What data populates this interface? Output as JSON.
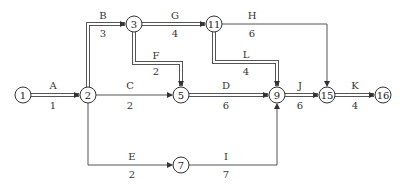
{
  "diagram": {
    "type": "activity-on-arrow network (double-line arrows mark critical path)",
    "nodes": [
      {
        "id": "1",
        "label": "1",
        "x": 23,
        "y": 95
      },
      {
        "id": "2",
        "label": "2",
        "x": 88,
        "y": 95
      },
      {
        "id": "3",
        "label": "3",
        "x": 134,
        "y": 24
      },
      {
        "id": "11",
        "label": "11",
        "x": 214,
        "y": 24
      },
      {
        "id": "5",
        "label": "5",
        "x": 181,
        "y": 95
      },
      {
        "id": "9",
        "label": "9",
        "x": 277,
        "y": 95
      },
      {
        "id": "15",
        "label": "15",
        "x": 327,
        "y": 95
      },
      {
        "id": "16",
        "label": "16",
        "x": 383,
        "y": 95
      },
      {
        "id": "7",
        "label": "7",
        "x": 181,
        "y": 165
      }
    ],
    "activities": [
      {
        "name": "A",
        "duration": "1",
        "from": "1",
        "to": "2",
        "critical": true
      },
      {
        "name": "B",
        "duration": "3",
        "from": "2",
        "to": "3",
        "critical": true
      },
      {
        "name": "C",
        "duration": "2",
        "from": "2",
        "to": "5",
        "critical": false
      },
      {
        "name": "E",
        "duration": "2",
        "from": "2",
        "to": "7",
        "critical": false
      },
      {
        "name": "G",
        "duration": "4",
        "from": "3",
        "to": "11",
        "critical": true
      },
      {
        "name": "F",
        "duration": "2",
        "from": "3",
        "to": "5",
        "critical": true
      },
      {
        "name": "H",
        "duration": "6",
        "from": "11",
        "to": "15",
        "critical": false
      },
      {
        "name": "L",
        "duration": "4",
        "from": "11",
        "to": "9",
        "critical": true
      },
      {
        "name": "D",
        "duration": "6",
        "from": "5",
        "to": "9",
        "critical": true
      },
      {
        "name": "I",
        "duration": "7",
        "from": "7",
        "to": "9",
        "critical": false
      },
      {
        "name": "J",
        "duration": "6",
        "from": "9",
        "to": "15",
        "critical": true
      },
      {
        "name": "K",
        "duration": "4",
        "from": "15",
        "to": "16",
        "critical": true
      }
    ]
  }
}
